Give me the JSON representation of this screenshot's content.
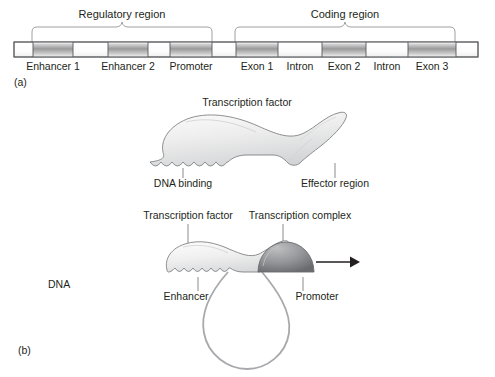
{
  "figure": {
    "panel_a": {
      "id": "(a)",
      "brackets": [
        {
          "label": "Regulatory region",
          "x1": 32,
          "x2": 212,
          "label_x": 122,
          "label_y": 22
        },
        {
          "label": "Coding region",
          "x1": 235,
          "x2": 455,
          "label_x": 345,
          "label_y": 22
        }
      ],
      "bar": {
        "x": 14,
        "width": 464,
        "y": 42,
        "height": 15,
        "outline_color": "#58595b",
        "fill_color": "#ffffff",
        "segment_fill_light": "#f1f1f1",
        "segment_fill_dark": "#9d9d9d"
      },
      "segments": [
        {
          "label": "Enhancer 1",
          "x": 33,
          "width": 40,
          "filled": true,
          "label_x": 53
        },
        {
          "label": "Enhancer 2",
          "x": 108,
          "width": 40,
          "filled": true,
          "label_x": 128
        },
        {
          "label": "Promoter",
          "x": 170,
          "width": 42,
          "filled": true,
          "label_x": 191
        },
        {
          "label": "Exon 1",
          "x": 236,
          "width": 42,
          "filled": true,
          "label_x": 257
        },
        {
          "label": "Intron",
          "x": 278,
          "width": 44,
          "filled": false,
          "label_x": 300
        },
        {
          "label": "Exon 2",
          "x": 322,
          "width": 44,
          "filled": true,
          "label_x": 344
        },
        {
          "label": "Intron",
          "x": 366,
          "width": 42,
          "filled": false,
          "label_x": 387
        },
        {
          "label": "Exon 3",
          "x": 408,
          "width": 48,
          "filled": true,
          "label_x": 432
        }
      ],
      "segment_label_y": 70
    },
    "panel_b": {
      "id": "(b)",
      "top_diagram": {
        "title": "Transcription factor",
        "title_x": 247,
        "title_y": 106,
        "labels": [
          {
            "text": "DNA binding",
            "x": 183,
            "y": 186,
            "leader_x": 183,
            "leader_y1": 168,
            "leader_y2": 178
          },
          {
            "text": "Effector region",
            "x": 335,
            "y": 186,
            "leader_x": 335,
            "leader_y1": 163,
            "leader_y2": 178
          }
        ]
      },
      "bottom_diagram": {
        "labels_top": [
          {
            "text": "Transcription factor",
            "x": 188,
            "y": 219,
            "leader_x": 188,
            "leader_y1": 224,
            "leader_y2": 249
          },
          {
            "text": "Transcription complex",
            "x": 300,
            "y": 219,
            "leader_x": 283,
            "leader_y1": 224,
            "leader_y2": 246
          }
        ],
        "labels_bottom": [
          {
            "text": "Enhancer",
            "x": 185,
            "y": 300,
            "leader_x": 198,
            "leader_y1": 277,
            "leader_y2": 291
          },
          {
            "text": "Promoter",
            "x": 317,
            "y": 300,
            "leader_x": 303,
            "leader_y1": 277,
            "leader_y2": 291
          }
        ],
        "dna_label": {
          "text": "DNA",
          "x": 62,
          "y": 288
        },
        "dna_line_y": 272,
        "dna_line_x1": 20,
        "dna_line_x2": 470,
        "arrow": {
          "x1": 316,
          "x2": 356,
          "y": 262,
          "direction": "right"
        },
        "complex_color_top": "#a6a8ab",
        "complex_color_bottom": "#707073",
        "factor_color": "#eeeeee"
      }
    },
    "colors": {
      "text": "#231f20",
      "line_gray": "#a7a9ac",
      "outline": "#58595b",
      "bracket": "#939598"
    }
  }
}
